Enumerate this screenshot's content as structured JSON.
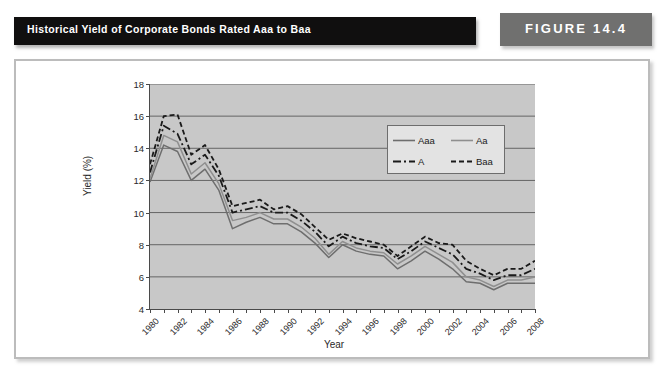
{
  "header": {
    "title": "Historical Yield of Corporate Bonds Rated Aaa to Baa",
    "figure_label": "FIGURE 14.4",
    "title_bar_color": "#100f0f",
    "figure_tag_color": "#70706f"
  },
  "chart_data": {
    "type": "line",
    "title": "Historical Yield of Corporate Bonds Rated Aaa to Baa",
    "xlabel": "Year",
    "ylabel": "Yield (%)",
    "xlim": [
      1980,
      2008
    ],
    "ylim": [
      4,
      18
    ],
    "yticks": [
      4,
      6,
      8,
      10,
      12,
      14,
      16,
      18
    ],
    "grid": "horizontal",
    "legend_position": "upper-right-inside",
    "plot_background": "#c8c8c8",
    "x": [
      1980,
      1981,
      1982,
      1983,
      1984,
      1985,
      1986,
      1987,
      1988,
      1989,
      1990,
      1991,
      1992,
      1993,
      1994,
      1995,
      1996,
      1997,
      1998,
      1999,
      2000,
      2001,
      2002,
      2003,
      2004,
      2005,
      2006,
      2007,
      2008
    ],
    "xtick_labels": [
      "1980",
      "1982",
      "1984",
      "1986",
      "1988",
      "1990",
      "1992",
      "1994",
      "1996",
      "1998",
      "2000",
      "2002",
      "2004",
      "2006",
      "2008"
    ],
    "series": [
      {
        "name": "Aaa",
        "style": "solid",
        "color": "#6e6e6e",
        "values": [
          11.9,
          14.2,
          13.8,
          12.0,
          12.7,
          11.4,
          9.0,
          9.4,
          9.7,
          9.3,
          9.3,
          8.8,
          8.1,
          7.2,
          8.0,
          7.6,
          7.4,
          7.3,
          6.5,
          7.0,
          7.6,
          7.1,
          6.5,
          5.7,
          5.6,
          5.2,
          5.6,
          5.6,
          5.6
        ]
      },
      {
        "name": "Aa",
        "style": "solid",
        "color": "#8f8f8f",
        "values": [
          12.1,
          14.8,
          14.4,
          12.4,
          13.1,
          11.8,
          9.5,
          9.7,
          10.0,
          9.6,
          9.6,
          9.1,
          8.4,
          7.4,
          8.2,
          7.8,
          7.6,
          7.5,
          6.8,
          7.3,
          7.9,
          7.4,
          6.9,
          6.0,
          5.8,
          5.4,
          5.8,
          5.8,
          6.0
        ]
      },
      {
        "name": "A",
        "style": "dashdot",
        "color": "#1a1a1a",
        "values": [
          12.5,
          15.4,
          14.9,
          13.0,
          13.6,
          12.3,
          10.0,
          10.2,
          10.4,
          10.0,
          10.0,
          9.5,
          8.8,
          7.9,
          8.5,
          8.1,
          7.9,
          7.8,
          7.1,
          7.6,
          8.2,
          7.8,
          7.4,
          6.5,
          6.2,
          5.8,
          6.1,
          6.1,
          6.5
        ]
      },
      {
        "name": "Baa",
        "style": "dashed",
        "color": "#1a1a1a",
        "values": [
          13.0,
          16.0,
          16.1,
          13.6,
          14.2,
          12.7,
          10.4,
          10.6,
          10.8,
          10.2,
          10.4,
          9.9,
          9.1,
          8.3,
          8.7,
          8.4,
          8.2,
          8.0,
          7.3,
          7.9,
          8.5,
          8.1,
          8.0,
          7.0,
          6.5,
          6.1,
          6.5,
          6.5,
          7.0
        ]
      }
    ]
  }
}
